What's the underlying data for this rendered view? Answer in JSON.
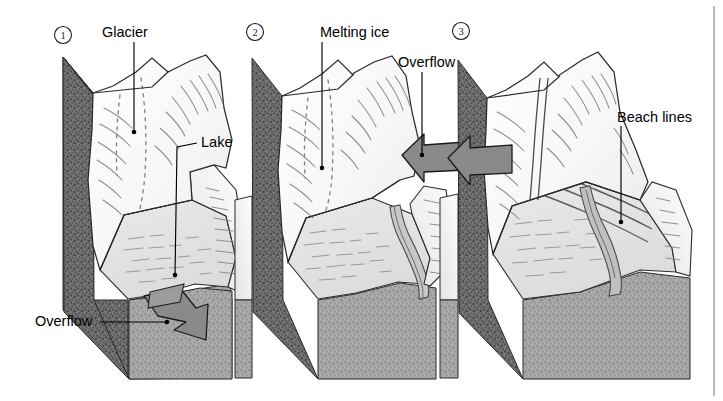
{
  "figure": {
    "width": 723,
    "height": 401,
    "background": "#ffffff",
    "border_right": true
  },
  "palette": {
    "ink": "#1a1a1a",
    "outline": "#2b2b2b",
    "ice_light": "#fcfcfc",
    "ice_shade": "#e9e9e9",
    "ice_shade2": "#dedede",
    "lake": "#e2e2e2",
    "lake_dark": "#d2d2d2",
    "bedrock_dark": "#6d6d6d",
    "bedrock_mid": "#8e8e8e",
    "bedrock_light": "#a8a8a8",
    "arrow_fill": "#8a8a8a",
    "arrow_stroke": "#1a1a1a",
    "leader": "#000000"
  },
  "panels": [
    {
      "id": "panel-1",
      "number": "1",
      "number_x": 63,
      "number_y": 35,
      "stage": "ice-dammed lake at glacial maximum",
      "labels": [
        {
          "key": "glacier",
          "text": "Glacier",
          "text_x": 102,
          "text_y": 33,
          "anchor": "start",
          "leader": {
            "x1": 134,
            "y1": 42,
            "x2": 134,
            "y2": 132
          },
          "dot": {
            "x": 134,
            "y": 132
          }
        },
        {
          "key": "lake",
          "text": "Lake",
          "text_x": 201,
          "text_y": 143,
          "anchor": "start",
          "leader_path": "M 197 143 L 175 146 L 175 275",
          "dot": {
            "x": 175,
            "y": 275
          }
        },
        {
          "key": "overflow",
          "text": "Overflow",
          "text_x": 35,
          "text_y": 322,
          "anchor": "start",
          "leader": {
            "x1": 100,
            "y1": 322,
            "x2": 165,
            "y2": 322
          },
          "dot": {
            "x": 165,
            "y": 322
          }
        }
      ]
    },
    {
      "id": "panel-2",
      "number": "2",
      "number_x": 255,
      "number_y": 32,
      "stage": "melting ice, lake drains through overflow channel",
      "labels": [
        {
          "key": "melting-ice",
          "text": "Melting ice",
          "text_x": 320,
          "text_y": 33,
          "anchor": "start",
          "leader": {
            "x1": 322,
            "y1": 42,
            "x2": 322,
            "y2": 168
          },
          "dot": {
            "x": 322,
            "y": 168
          }
        },
        {
          "key": "overflow",
          "text": "Overflow",
          "text_x": 398,
          "text_y": 63,
          "anchor": "start",
          "leader": {
            "x1": 422,
            "y1": 72,
            "x2": 422,
            "y2": 155
          },
          "dot": {
            "x": 422,
            "y": 155
          }
        }
      ]
    },
    {
      "id": "panel-3",
      "number": "3",
      "number_x": 461,
      "number_y": 31,
      "stage": "ice gone, abandoned beach lines terrace the valley",
      "labels": [
        {
          "key": "beach-lines",
          "text": "Beach lines",
          "text_x": 617,
          "text_y": 118,
          "anchor": "start",
          "leader_path": "M 621 126 L 621 150 L 621 220",
          "dot": {
            "x": 621,
            "y": 220
          }
        }
      ]
    }
  ],
  "arrows": [
    {
      "key": "overflow-arrow-panel-1",
      "panel": "panel-1",
      "direction": "down-right",
      "tip_x": 205,
      "tip_y": 340
    },
    {
      "key": "overflow-arrow-panel-2",
      "panel": "panel-2",
      "direction": "left",
      "tip_x": 402,
      "tip_y": 155
    },
    {
      "key": "overflow-arrow-panel-3",
      "panel": "panel-3",
      "direction": "left",
      "tip_x": 448,
      "tip_y": 158
    }
  ],
  "features": {
    "glacier_label": "Glacier",
    "lake_label": "Lake",
    "overflow_label": "Overflow",
    "melting_ice_label": "Melting ice",
    "beach_lines_label": "Beach lines"
  }
}
